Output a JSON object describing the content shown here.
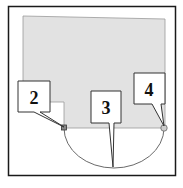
{
  "diagram": {
    "colors": {
      "frame": "#1a1a1a",
      "region_fill": "#e2e2e2",
      "region_stroke": "#9a9a9a",
      "arc": "#6a6a6a",
      "callout_fill": "#ffffff",
      "callout_stroke": "#333333"
    },
    "callouts": [
      {
        "id": "2",
        "label": "2",
        "target": "square-marker"
      },
      {
        "id": "3",
        "label": "3",
        "target": "arc-bottom"
      },
      {
        "id": "4",
        "label": "4",
        "target": "circle-marker"
      }
    ],
    "markers": [
      {
        "name": "square-marker",
        "shape": "square"
      },
      {
        "name": "circle-marker",
        "shape": "circle"
      }
    ]
  }
}
